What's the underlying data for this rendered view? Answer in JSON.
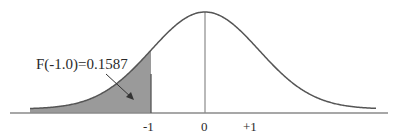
{
  "chart_data": {
    "type": "area",
    "title": "",
    "distribution": "standard normal",
    "mean": 0,
    "sd": 1,
    "xlabel": "",
    "ylabel": "",
    "x_ticks": [
      "-1",
      "0",
      "+1"
    ],
    "shaded_region": {
      "from": "-inf",
      "to": -1.0,
      "area": 0.1587
    },
    "annotation": {
      "text": "F(-1.0)=0.1587",
      "points_to": "shaded region"
    },
    "grid": false,
    "legend": "none",
    "colors": {
      "curve": "#555555",
      "shade": "#9a9a9a",
      "axis": "#8a8a8a"
    }
  },
  "labels": {
    "annotation": "F(-1.0)=0.1587",
    "tick_neg1": "-1",
    "tick_0": "0",
    "tick_pos1": "+1"
  }
}
